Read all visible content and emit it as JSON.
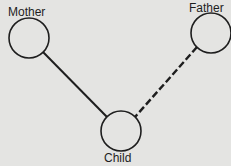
{
  "diagram": {
    "type": "family-relationship",
    "background": "#e4e4e2",
    "stroke_color": "#1e1e1e",
    "nodes": [
      {
        "id": "mother",
        "label": "Mother",
        "cx": 29,
        "cy": 38,
        "r": 20
      },
      {
        "id": "father",
        "label": "Father",
        "cx": 211,
        "cy": 33,
        "r": 20
      },
      {
        "id": "child",
        "label": "Child",
        "cx": 121,
        "cy": 131,
        "r": 20
      }
    ],
    "edges": [
      {
        "from": "mother",
        "to": "child",
        "style": "solid"
      },
      {
        "from": "father",
        "to": "child",
        "style": "dashed"
      }
    ]
  }
}
